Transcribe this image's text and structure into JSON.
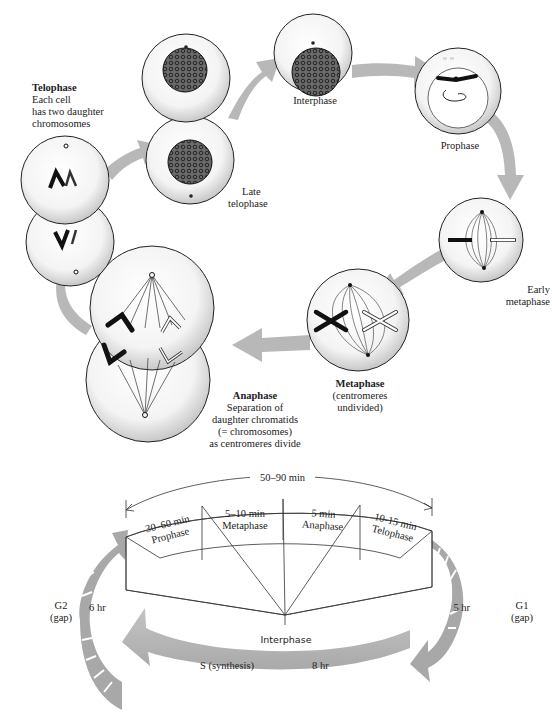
{
  "figure": {
    "top_cycle": {
      "stages": [
        {
          "id": "interphase",
          "label": "Interphase"
        },
        {
          "id": "prophase",
          "label": "Prophase"
        },
        {
          "id": "early_metaphase",
          "label_line1": "Early",
          "label_line2": "metaphase"
        },
        {
          "id": "metaphase",
          "label": "Metaphase",
          "note_line1": "(centromeres",
          "note_line2": "undivided)"
        },
        {
          "id": "anaphase",
          "label": "Anaphase",
          "note_line1": "Separation of",
          "note_line2": "daughter chromatids",
          "note_line3": "(= chromosomes)",
          "note_line4": "as centromeres divide"
        },
        {
          "id": "telophase",
          "label": "Telophase",
          "note_line1": "Each cell",
          "note_line2": "has two daughter",
          "note_line3": "chromosomes"
        },
        {
          "id": "late_telophase",
          "label_line1": "Late",
          "label_line2": "telophase"
        }
      ]
    },
    "bottom_cycle": {
      "mitosis_total": "50–90 min",
      "mitosis_phases": [
        {
          "duration": "30–60 min",
          "name": "Prophase"
        },
        {
          "duration": "5–10 min",
          "name": "Metaphase"
        },
        {
          "duration": "5 min",
          "name": "Anaphase"
        },
        {
          "duration": "10-15 min",
          "name": "Telophase"
        }
      ],
      "interphase_label": "Interphase",
      "g1": {
        "label": "G1",
        "sub": "(gap)",
        "duration": "5 hr"
      },
      "s": {
        "label": "S  (synthesis)",
        "duration": "8 hr"
      },
      "g2": {
        "label": "G2",
        "sub": "(gap)",
        "duration": "6 hr"
      }
    },
    "colors": {
      "arrow_gray": "#b5b5b5",
      "outline": "#222222",
      "chromosome_dark": "#1a1a1a"
    }
  }
}
